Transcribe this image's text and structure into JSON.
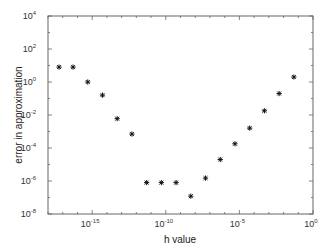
{
  "chart_data": {
    "type": "scatter",
    "title": "",
    "xlabel": "h value",
    "ylabel": "error in approximation",
    "xscale": "log",
    "yscale": "log",
    "xlim_exp": [
      -18,
      0
    ],
    "ylim_exp": [
      -8,
      4
    ],
    "x_ticks": [
      {
        "base": "10",
        "exp": "-15",
        "value": -15
      },
      {
        "base": "10",
        "exp": "-10",
        "value": -10
      },
      {
        "base": "10",
        "exp": "-5",
        "value": -5
      },
      {
        "base": "10",
        "exp": "0",
        "value": 0
      }
    ],
    "y_ticks": [
      {
        "base": "10",
        "exp": "4",
        "value": 4
      },
      {
        "base": "10",
        "exp": "2",
        "value": 2
      },
      {
        "base": "10",
        "exp": "0",
        "value": 0
      },
      {
        "base": "10",
        "exp": "-2",
        "value": -2
      },
      {
        "base": "10",
        "exp": "-4",
        "value": -4
      },
      {
        "base": "10",
        "exp": "-6",
        "value": -6
      },
      {
        "base": "10",
        "exp": "-8",
        "value": -8
      }
    ],
    "marker": "asterisk",
    "grid": false,
    "legend": null,
    "series": [
      {
        "name": "error",
        "points": [
          {
            "x_exp": -17.25,
            "y": 8
          },
          {
            "x_exp": -16.3,
            "y": 8
          },
          {
            "x_exp": -15.3,
            "y": 1
          },
          {
            "x_exp": -14.3,
            "y": 0.16
          },
          {
            "x_exp": -13.3,
            "y": 0.006
          },
          {
            "x_exp": -12.3,
            "y": 0.0007
          },
          {
            "x_exp": -11.3,
            "y": 8e-07
          },
          {
            "x_exp": -10.3,
            "y": 8e-07
          },
          {
            "x_exp": -9.3,
            "y": 8e-07
          },
          {
            "x_exp": -8.3,
            "y": 1.2e-07
          },
          {
            "x_exp": -7.3,
            "y": 1.5e-06
          },
          {
            "x_exp": -6.3,
            "y": 2e-05
          },
          {
            "x_exp": -5.3,
            "y": 0.00018
          },
          {
            "x_exp": -4.3,
            "y": 0.0016
          },
          {
            "x_exp": -3.3,
            "y": 0.018
          },
          {
            "x_exp": -2.3,
            "y": 0.2
          },
          {
            "x_exp": -1.3,
            "y": 2
          }
        ]
      }
    ]
  }
}
